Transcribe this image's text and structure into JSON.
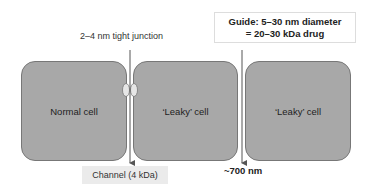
{
  "diagram": {
    "junction_label": "2–4 nm tight junction",
    "guide": {
      "line1": "Guide: 5–30 nm diameter",
      "line2": "= 20–30 kDa drug"
    },
    "cells": [
      {
        "label": "Normal cell"
      },
      {
        "label": "‘Leaky’ cell"
      },
      {
        "label": "‘Leaky’ cell"
      }
    ],
    "channel_label": "Channel (4 kDa)",
    "gap_label": "~700 nm",
    "colors": {
      "cell_fill": "#a8a8a8",
      "cell_border": "#777777",
      "junction_fill": "#e6e6e6",
      "channel_bg": "#ebebeb"
    }
  }
}
